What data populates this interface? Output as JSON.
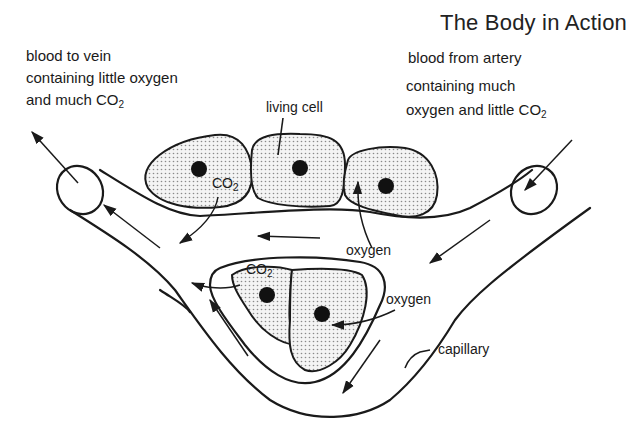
{
  "header": {
    "title": "The Body in Action"
  },
  "labels": {
    "vein": {
      "line1": "blood to vein",
      "line2": "containing little oxygen",
      "line3_prefix": "and much CO",
      "line3_sub": "2"
    },
    "artery": {
      "line1": "blood from artery",
      "line2": "containing much",
      "line3_prefix": "oxygen and little CO",
      "line3_sub": "2"
    },
    "living_cell": "living cell",
    "co2_upper": {
      "prefix": "CO",
      "sub": "2"
    },
    "co2_lower": {
      "prefix": "CO",
      "sub": "2"
    },
    "oxygen_upper": "oxygen",
    "oxygen_lower": "oxygen",
    "capillary": "capillary"
  },
  "colors": {
    "ink": "#1a1a1a",
    "background": "#ffffff",
    "stipple": "#9a9a9a"
  }
}
